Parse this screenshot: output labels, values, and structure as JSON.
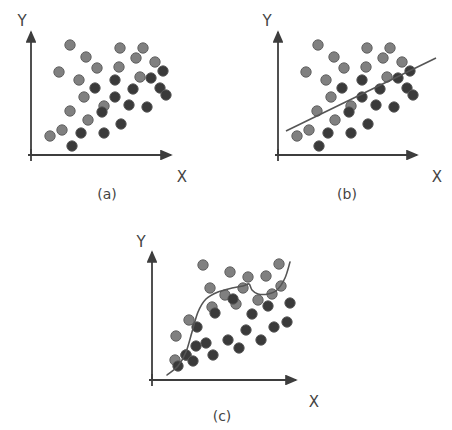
{
  "figure": {
    "background_color": "#ffffff",
    "axis_color": "#3d3d3d",
    "curve_color": "#555555",
    "point_light_color": "#808080",
    "point_dark_color": "#3a3a3a",
    "point_stroke_color": "#5a5a5a",
    "point_radius": 5.2,
    "width": 452,
    "height": 430
  },
  "chart_data": [
    {
      "type": "scatter",
      "panel": "a",
      "caption": "(a)",
      "title": "",
      "xlabel": "X",
      "ylabel": "Y",
      "grid": false,
      "legend": "none",
      "annotations": [],
      "axes": {
        "origin_x": 31,
        "origin_y": 155,
        "x_end": 175,
        "y_top": 28,
        "x_label_pos": [
          182,
          177
        ],
        "y_label_pos": [
          22,
          22
        ],
        "caption_pos": [
          107,
          196
        ]
      },
      "series": [
        {
          "name": "light-points",
          "color": "#808080",
          "points": [
            [
              70,
              45
            ],
            [
              86,
              57
            ],
            [
              97,
              68
            ],
            [
              119,
              67
            ],
            [
              136,
              58
            ],
            [
              140,
              77
            ],
            [
              143,
              48
            ],
            [
              59,
              72
            ],
            [
              79,
              80
            ],
            [
              84,
              97
            ],
            [
              70,
              111
            ],
            [
              50,
              136
            ],
            [
              62,
              130
            ],
            [
              88,
              120
            ],
            [
              104,
              106
            ],
            [
              155,
              62
            ],
            [
              120,
              48
            ]
          ]
        },
        {
          "name": "dark-points",
          "color": "#3a3a3a",
          "points": [
            [
              115,
              80
            ],
            [
              95,
              88
            ],
            [
              115,
              97
            ],
            [
              129,
              105
            ],
            [
              133,
              89
            ],
            [
              151,
              78
            ],
            [
              160,
              88
            ],
            [
              102,
              112
            ],
            [
              121,
              124
            ],
            [
              147,
              107
            ],
            [
              166,
              95
            ],
            [
              72,
              146
            ],
            [
              81,
              133
            ],
            [
              104,
              133
            ],
            [
              163,
              71
            ]
          ]
        }
      ]
    },
    {
      "type": "scatter",
      "panel": "b",
      "caption": "(b)",
      "title": "",
      "xlabel": "X",
      "ylabel": "Y",
      "grid": false,
      "legend": "none",
      "annotations": [
        "linear fit line"
      ],
      "axes": {
        "origin_x": 278,
        "origin_y": 155,
        "x_end": 421,
        "y_top": 28,
        "x_label_pos": [
          436,
          177
        ],
        "y_label_pos": [
          266,
          22
        ],
        "caption_pos": [
          347,
          196
        ]
      },
      "fit_line": {
        "type": "line",
        "x1": 286,
        "y1": 131,
        "x2": 436,
        "y2": 58,
        "color": "#555555",
        "width": 1.6
      },
      "series": [
        {
          "name": "light-points",
          "color": "#808080",
          "points": [
            [
              318,
              45
            ],
            [
              334,
              57
            ],
            [
              344,
              68
            ],
            [
              366,
              67
            ],
            [
              383,
              58
            ],
            [
              387,
              77
            ],
            [
              390,
              48
            ],
            [
              306,
              72
            ],
            [
              326,
              80
            ],
            [
              331,
              97
            ],
            [
              317,
              111
            ],
            [
              297,
              136
            ],
            [
              309,
              130
            ],
            [
              335,
              120
            ],
            [
              351,
              106
            ],
            [
              402,
              62
            ],
            [
              367,
              48
            ]
          ]
        },
        {
          "name": "dark-points",
          "color": "#3a3a3a",
          "points": [
            [
              362,
              80
            ],
            [
              342,
              88
            ],
            [
              362,
              97
            ],
            [
              376,
              105
            ],
            [
              380,
              89
            ],
            [
              398,
              78
            ],
            [
              407,
              88
            ],
            [
              349,
              112
            ],
            [
              368,
              124
            ],
            [
              394,
              107
            ],
            [
              413,
              95
            ],
            [
              319,
              146
            ],
            [
              328,
              133
            ],
            [
              351,
              133
            ],
            [
              410,
              71
            ]
          ]
        }
      ]
    },
    {
      "type": "scatter",
      "panel": "c",
      "caption": "(c)",
      "title": "",
      "xlabel": "X",
      "ylabel": "Y",
      "grid": false,
      "legend": "none",
      "annotations": [
        "smoothed nonlinear fit curve"
      ],
      "axes": {
        "origin_x": 152,
        "origin_y": 380,
        "x_end": 300,
        "y_top": 248,
        "x_label_pos": [
          313,
          402
        ],
        "y_label_pos": [
          140,
          243
        ],
        "caption_pos": [
          222,
          417
        ]
      },
      "fit_curve": {
        "type": "smooth",
        "color": "#555555",
        "width": 1.6,
        "path_points": [
          [
            167,
            375
          ],
          [
            178,
            366
          ],
          [
            186,
            352
          ],
          [
            192,
            332
          ],
          [
            198,
            312
          ],
          [
            206,
            299
          ],
          [
            218,
            292
          ],
          [
            232,
            288
          ],
          [
            243,
            286
          ],
          [
            249,
            284
          ],
          [
            252,
            290
          ],
          [
            258,
            294
          ],
          [
            268,
            294
          ],
          [
            277,
            290
          ],
          [
            285,
            278
          ],
          [
            290,
            262
          ]
        ]
      },
      "series": [
        {
          "name": "light-points",
          "color": "#808080",
          "points": [
            [
              230,
              272
            ],
            [
              243,
              288
            ],
            [
              176,
              336
            ],
            [
              186,
              355
            ],
            [
              175,
              360
            ],
            [
              210,
              288
            ],
            [
              212,
              307
            ],
            [
              236,
              304
            ],
            [
              189,
              320
            ],
            [
              203,
              265
            ],
            [
              248,
              277
            ],
            [
              266,
              276
            ],
            [
              279,
              264
            ],
            [
              281,
              286
            ],
            [
              272,
              294
            ],
            [
              258,
              300
            ],
            [
              225,
              295
            ]
          ]
        },
        {
          "name": "dark-points",
          "color": "#3a3a3a",
          "points": [
            [
              233,
              299
            ],
            [
              215,
              313
            ],
            [
              197,
              327
            ],
            [
              206,
              343
            ],
            [
              186,
              355
            ],
            [
              178,
              366
            ],
            [
              193,
              361
            ],
            [
              213,
              355
            ],
            [
              228,
              340
            ],
            [
              246,
              330
            ],
            [
              252,
              314
            ],
            [
              268,
              306
            ],
            [
              274,
              327
            ],
            [
              287,
              322
            ],
            [
              290,
              303
            ],
            [
              196,
              346
            ],
            [
              239,
              348
            ],
            [
              261,
              340
            ]
          ]
        }
      ]
    }
  ]
}
